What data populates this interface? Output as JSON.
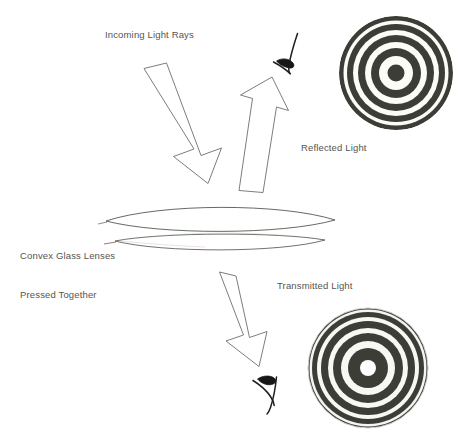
{
  "diagram": {
    "background_color": "#ffffff",
    "ink_color": "#5a5a55",
    "ring_color": "#3d3d37",
    "outline_color": "#6b6b66",
    "labels": {
      "incoming": "Incoming Light Rays",
      "reflected": "Reflected Light",
      "transmitted": "Transmitted Light",
      "lenses_line1": "Convex Glass Lenses",
      "lenses_line2": "Pressed Together"
    },
    "arrows": [
      {
        "name": "incoming-light-arrow",
        "direction": "down-right",
        "label": "Incoming Light Rays",
        "start": [
          144,
          68
        ],
        "end": [
          208,
          182
        ]
      },
      {
        "name": "reflected-light-arrow",
        "direction": "up-right",
        "label": "Reflected Light",
        "start": [
          240,
          190
        ],
        "end": [
          296,
          92
        ]
      },
      {
        "name": "transmitted-light-arrow",
        "direction": "down-right",
        "label": "Transmitted Light",
        "start": [
          219,
          272
        ],
        "end": [
          266,
          364
        ]
      }
    ],
    "observers": [
      {
        "name": "eye-symbol-reflected",
        "position": [
          288,
          55
        ]
      },
      {
        "name": "eye-symbol-transmitted",
        "position": [
          266,
          392
        ]
      }
    ],
    "lenses": [
      {
        "name": "upper-convex-lens",
        "left": 105,
        "right": 336,
        "center_y": 221,
        "top_bulge": 14,
        "bottom_bulge": 12
      },
      {
        "name": "lower-convex-lens",
        "left": 114,
        "right": 326,
        "center_y": 243,
        "top_bulge": 6,
        "bottom_bulge": 8
      }
    ],
    "ring_patterns": [
      {
        "name": "reflected-newtons-rings",
        "center": [
          396,
          73
        ],
        "outer_radius": 57,
        "center_color": "dark",
        "description": "Newton's rings seen in reflected light - dark central spot",
        "bands": [
          {
            "r_outer": 8.5,
            "color": "dark"
          },
          {
            "r_outer": 17,
            "color": "light"
          },
          {
            "r_outer": 25,
            "color": "dark"
          },
          {
            "r_outer": 31,
            "color": "light"
          },
          {
            "r_outer": 38,
            "color": "dark"
          },
          {
            "r_outer": 43,
            "color": "light"
          },
          {
            "r_outer": 49,
            "color": "dark"
          },
          {
            "r_outer": 52.5,
            "color": "light"
          },
          {
            "r_outer": 57,
            "color": "dark"
          }
        ]
      },
      {
        "name": "transmitted-newtons-rings",
        "center": [
          368,
          368
        ],
        "outer_radius": 60,
        "center_color": "light",
        "description": "Newton's rings seen in transmitted light - bright central spot",
        "bands": [
          {
            "r_outer": 8,
            "color": "light"
          },
          {
            "r_outer": 20,
            "color": "dark"
          },
          {
            "r_outer": 27,
            "color": "light"
          },
          {
            "r_outer": 35,
            "color": "dark"
          },
          {
            "r_outer": 40,
            "color": "light"
          },
          {
            "r_outer": 47,
            "color": "dark"
          },
          {
            "r_outer": 51,
            "color": "light"
          },
          {
            "r_outer": 56,
            "color": "dark"
          },
          {
            "r_outer": 58.5,
            "color": "light"
          },
          {
            "r_outer": 60,
            "color": "dark"
          }
        ]
      }
    ]
  }
}
